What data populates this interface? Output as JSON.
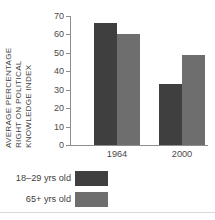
{
  "chart_data": {
    "type": "bar",
    "title": "",
    "subtitle": "",
    "xlabel": "",
    "ylabel": "AVERAGE PERCENTAGE RIGHT ON POLITICAL KNOWLEDGE INDEX",
    "ylabel_lines": [
      "AVERAGE PERCENTAGE",
      "RIGHT ON POLITICAL",
      "KNOWLEDGE INDEX"
    ],
    "categories": [
      "1964",
      "2000"
    ],
    "series": [
      {
        "name": "18–29 yrs old",
        "values": [
          66,
          33
        ],
        "color": "#3f3f3f"
      },
      {
        "name": "65+ yrs old",
        "values": [
          60,
          49
        ],
        "color": "#6e6e6e"
      }
    ],
    "ylim": [
      0,
      70
    ],
    "yticks": [
      70,
      60,
      50,
      40,
      30,
      20,
      10,
      0
    ],
    "ytick_labels": [
      "70",
      "60",
      "50",
      "40",
      "30",
      "20",
      "10",
      "0"
    ],
    "grid": false,
    "legend_position": "bottom-left"
  },
  "axis": {
    "ytick_labels": [
      "70",
      "60",
      "50",
      "40",
      "30",
      "20",
      "10",
      "0"
    ],
    "xtick_labels": [
      "1964",
      "2000"
    ]
  },
  "legend": {
    "rows": [
      {
        "label": "18–29 yrs old",
        "color": "#3f3f3f"
      },
      {
        "label": "65+ yrs old",
        "color": "#6e6e6e"
      }
    ]
  },
  "colors": {
    "bar_dark": "#3f3f3f",
    "bar_light": "#6e6e6e",
    "axis": "#8d8d8d",
    "text": "#3f3f3f",
    "background": "#ffffff"
  }
}
